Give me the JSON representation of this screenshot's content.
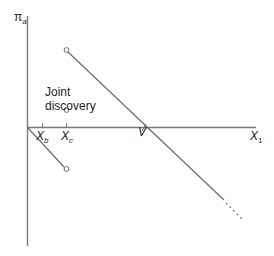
{
  "diagram": {
    "y_axis_label": {
      "symbol": "π",
      "subscript": "a"
    },
    "x_axis_label": {
      "symbol": "X",
      "subscript": "1"
    },
    "tick_labels": [
      {
        "symbol": "X",
        "subscript": "b"
      },
      {
        "symbol": "X",
        "subscript": "c"
      }
    ],
    "intercept_label": "V",
    "annotation": {
      "line1": "Joint",
      "line2": "discovery"
    },
    "colors": {
      "axis": "#7a7a7a",
      "line": "#6a6a6a",
      "text": "#222222"
    }
  }
}
